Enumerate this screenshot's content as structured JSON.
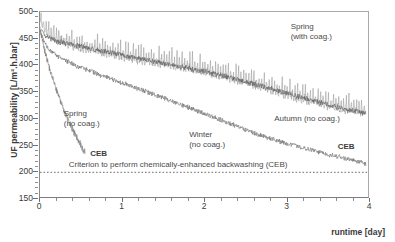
{
  "figure": {
    "background": "#ffffff",
    "frame_color": "#a9a9a9"
  },
  "chart_data": {
    "type": "line",
    "title": "",
    "xlabel": "runtime [day]",
    "ylabel": "UF permeability [L/m².h.bar]",
    "xlim": [
      0,
      4
    ],
    "ylim": [
      150,
      500
    ],
    "xticks": [
      "0",
      "1",
      "2",
      "3",
      "4"
    ],
    "xtick_values": [
      0,
      1,
      2,
      3,
      4
    ],
    "xminor_step": 0.2,
    "yticks": [
      "150",
      "200",
      "250",
      "300",
      "350",
      "400",
      "450",
      "500"
    ],
    "ytick_values": [
      150,
      200,
      250,
      300,
      350,
      400,
      450,
      500
    ],
    "yminor_step": 10,
    "grid": false,
    "legend": "in-plot annotations",
    "threshold": {
      "value": 200,
      "style": "dotted",
      "label": "Criterion to perform chemically-enhanced backwashing (CEB)"
    },
    "series": [
      {
        "name": "Spring (with coag.)",
        "color": "#9a9a9a",
        "noise_amplitude": 28,
        "noise_kind": "sawtooth-spikes",
        "x": [
          0.0,
          0.1,
          0.25,
          0.5,
          0.75,
          1.0,
          1.25,
          1.5,
          1.75,
          2.0,
          2.25,
          2.5,
          2.75,
          3.0,
          3.25,
          3.5,
          3.75,
          3.95
        ],
        "y": [
          480,
          452,
          440,
          428,
          420,
          412,
          404,
          398,
          392,
          384,
          374,
          364,
          352,
          340,
          330,
          320,
          312,
          308
        ]
      },
      {
        "name": "Autumn (no coag.)",
        "color": "#5e5e5e",
        "noise_amplitude": 9,
        "noise_kind": "dense-jitter",
        "x": [
          0.0,
          0.08,
          0.2,
          0.4,
          0.6,
          0.8,
          1.0,
          1.25,
          1.5,
          1.75,
          2.0,
          2.25,
          2.5,
          2.75,
          3.0,
          3.25,
          3.5,
          3.75,
          3.95
        ],
        "y": [
          468,
          452,
          444,
          437,
          430,
          424,
          418,
          410,
          402,
          395,
          387,
          378,
          368,
          357,
          346,
          335,
          325,
          315,
          309
        ]
      },
      {
        "name": "Winter (no coag.)",
        "color": "#6d6d6d",
        "noise_amplitude": 8,
        "noise_kind": "dense-jitter",
        "x": [
          0.0,
          0.1,
          0.25,
          0.5,
          0.75,
          1.0,
          1.25,
          1.5,
          1.75,
          2.0,
          2.25,
          2.5,
          2.75,
          3.0,
          3.25,
          3.5,
          3.75,
          3.95
        ],
        "y": [
          460,
          430,
          412,
          394,
          380,
          366,
          352,
          338,
          323,
          308,
          293,
          278,
          264,
          252,
          242,
          232,
          223,
          214
        ]
      },
      {
        "name": "Spring (no coag.)",
        "color": "#7a7a7a",
        "noise_amplitude": 11,
        "noise_kind": "dense-jitter",
        "x": [
          0.0,
          0.05,
          0.1,
          0.15,
          0.2,
          0.25,
          0.3,
          0.35,
          0.4,
          0.45,
          0.5,
          0.55
        ],
        "y": [
          468,
          430,
          400,
          375,
          352,
          330,
          310,
          292,
          276,
          262,
          248,
          234
        ]
      }
    ],
    "annotations": [
      {
        "id": "spring-no-coag",
        "text_lines": [
          "Spring",
          "(no coag.)"
        ],
        "x": 0.3,
        "y": 308
      },
      {
        "id": "spring-with-coag",
        "text_lines": [
          "Spring",
          "(with coag.)"
        ],
        "x": 3.05,
        "y": 470
      },
      {
        "id": "winter-no-coag",
        "text_lines": [
          "Winter",
          "(no coag.)"
        ],
        "x": 1.82,
        "y": 268
      },
      {
        "id": "autumn-no-coag",
        "text_lines": [
          "Autumn (no coag.)"
        ],
        "x": 2.85,
        "y": 298
      },
      {
        "id": "ceb-left",
        "text_lines": [
          "CEB"
        ],
        "x": 0.62,
        "y": 233
      },
      {
        "id": "ceb-right",
        "text_lines": [
          "CEB"
        ],
        "x": 3.62,
        "y": 245
      }
    ]
  }
}
